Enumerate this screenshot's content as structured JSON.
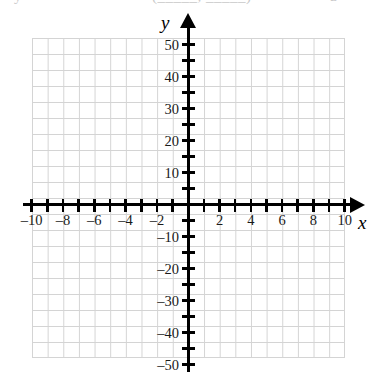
{
  "figure": {
    "type": "coordinate-grid",
    "axis_labels": {
      "x": "x",
      "y": "y"
    },
    "artifact_top": {
      "head": "y",
      "paren": "(_____, _____)",
      "tail": "a"
    }
  },
  "chart_data": {
    "type": "scatter",
    "title": "",
    "xlabel": "x",
    "ylabel": "y",
    "xlim": [
      -11,
      11
    ],
    "ylim": [
      -55,
      55
    ],
    "grid": true,
    "legend": "none",
    "series": [],
    "x_tick_labels": [
      "-10",
      "-8",
      "-6",
      "-4",
      "-2",
      "2",
      "4",
      "6",
      "8",
      "10"
    ],
    "x_tick_values": [
      -10,
      -8,
      -6,
      -4,
      -2,
      2,
      4,
      6,
      8,
      10
    ],
    "x_minor_ticks": [
      -10,
      -9,
      -8,
      -7,
      -6,
      -5,
      -4,
      -3,
      -2,
      -1,
      1,
      2,
      3,
      4,
      5,
      6,
      7,
      8,
      9,
      10
    ],
    "y_tick_labels": [
      "50",
      "40",
      "30",
      "20",
      "10",
      "-10",
      "-20",
      "-30",
      "-40",
      "-50"
    ],
    "y_tick_values": [
      50,
      40,
      30,
      20,
      10,
      -10,
      -20,
      -30,
      -40,
      -50
    ],
    "y_minor_ticks": [
      -50,
      -45,
      -40,
      -35,
      -30,
      -25,
      -20,
      -15,
      -10,
      -5,
      5,
      10,
      15,
      20,
      25,
      30,
      35,
      40,
      45,
      50
    ],
    "x_grid_step": 1,
    "y_grid_step": 5,
    "grid_x_range": [
      -10,
      10
    ],
    "grid_y_range": [
      -50,
      50
    ],
    "colors": {
      "axis": "#000000",
      "grid": "#d4d4d4",
      "label": "#1a1a1a",
      "background": "#ffffff"
    }
  }
}
